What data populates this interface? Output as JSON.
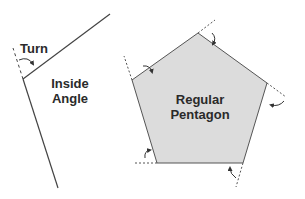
{
  "labels": {
    "turn": "Turn",
    "inside_angle_line1": "Inside",
    "inside_angle_line2": "Angle",
    "pentagon_line1": "Regular",
    "pentagon_line2": "Pentagon"
  },
  "colors": {
    "fill": "#dcdcdc",
    "stroke": "#444444",
    "text": "#2a2a2a"
  }
}
